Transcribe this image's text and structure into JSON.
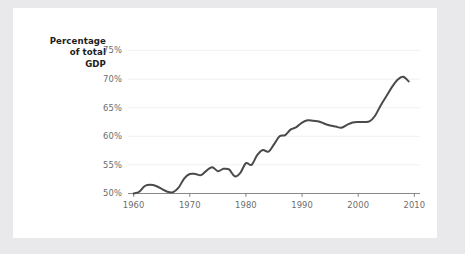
{
  "axis_label": {
    "line1": "Percentage",
    "line2": "of total",
    "line3": "GDP"
  },
  "chart_data": {
    "type": "line",
    "title": "",
    "subtitle": "",
    "xlabel": "",
    "ylabel": "Percentage of total GDP",
    "xlim": [
      1959,
      2011
    ],
    "ylim": [
      49.2,
      76.5
    ],
    "grid": true,
    "grid_axis": "y",
    "legend": false,
    "legend_position": "none",
    "line_color": "#4a4a4a",
    "line_width": 2.0,
    "axis_color": "#8a8a8a",
    "grid_color": "#f0f0f0",
    "tick_label_color": "#6d6d6d",
    "yticks": [
      50,
      55,
      60,
      65,
      70,
      75
    ],
    "ytick_labels": [
      "50%",
      "55%",
      "60%",
      "65%",
      "70%",
      "75%"
    ],
    "xticks": [
      1960,
      1970,
      1980,
      1990,
      2000,
      2010
    ],
    "xtick_labels": [
      "1960",
      "1970",
      "1980",
      "1990",
      "2000",
      "2010"
    ],
    "x": [
      1960,
      1961,
      1962,
      1963,
      1964,
      1965,
      1966,
      1967,
      1968,
      1969,
      1970,
      1971,
      1972,
      1973,
      1974,
      1975,
      1976,
      1977,
      1978,
      1979,
      1980,
      1981,
      1982,
      1983,
      1984,
      1985,
      1986,
      1987,
      1988,
      1989,
      1990,
      1991,
      1992,
      1993,
      1994,
      1995,
      1996,
      1997,
      1998,
      1999,
      2000,
      2001,
      2002,
      2003,
      2004,
      2005,
      2006,
      2007,
      2008,
      2009
    ],
    "values": [
      50.0,
      50.3,
      51.3,
      51.5,
      51.3,
      50.8,
      50.3,
      50.2,
      51.0,
      52.6,
      53.4,
      53.4,
      53.2,
      54.0,
      54.6,
      53.9,
      54.3,
      54.2,
      53.0,
      53.6,
      55.3,
      55.0,
      56.7,
      57.6,
      57.3,
      58.6,
      60.0,
      60.2,
      61.2,
      61.6,
      62.4,
      62.8,
      62.7,
      62.6,
      62.2,
      61.9,
      61.7,
      61.5,
      62.0,
      62.4,
      62.5,
      62.5,
      62.6,
      63.6,
      65.4,
      67.0,
      68.6,
      69.9,
      70.4,
      69.6
    ],
    "series_name": ""
  }
}
